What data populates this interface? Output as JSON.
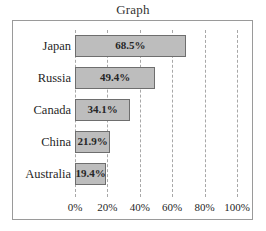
{
  "chart_data": {
    "type": "bar",
    "orientation": "horizontal",
    "title": "Graph",
    "xlabel": "",
    "ylabel": "",
    "categories": [
      "Japan",
      "Russia",
      "Canada",
      "China",
      "Australia"
    ],
    "values": [
      68.5,
      49.4,
      34.1,
      21.9,
      19.4
    ],
    "value_labels": [
      "68.5%",
      "49.4%",
      "34.1%",
      "21.9%",
      "19.4%"
    ],
    "xlim": [
      0,
      100
    ],
    "xticks": [
      0,
      20,
      40,
      60,
      80,
      100
    ],
    "xtick_labels": [
      "0%",
      "20%",
      "40%",
      "60%",
      "80%",
      "100%"
    ],
    "grid": true,
    "grid_style": "dashed-vertical",
    "legend": null,
    "bar_fill_color": "#bdbdbd",
    "bar_border_color": "#6e6e6e",
    "frame_color": "#9a9a9a",
    "gridline_color": "#a8a8a8",
    "text_color": "#1f1f1f"
  }
}
